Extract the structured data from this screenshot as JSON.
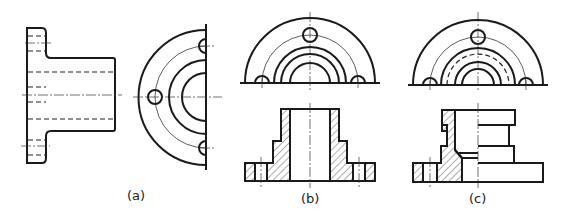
{
  "figure": {
    "labels": [
      {
        "id": "a",
        "text": "(a)"
      },
      {
        "id": "b",
        "text": "(b)"
      },
      {
        "id": "c",
        "text": "(c)"
      }
    ],
    "views": [
      {
        "id": "a",
        "description": "Flanged bushing: front view with hidden lines and side view (half circular view with 3 bolt holes)"
      },
      {
        "id": "b",
        "description": "Half top view and full section front view with hatching"
      },
      {
        "id": "c",
        "description": "Half top view and half section front view with hatching"
      }
    ],
    "colors": {
      "line": "#1a1a1a",
      "background": "#ffffff"
    }
  }
}
